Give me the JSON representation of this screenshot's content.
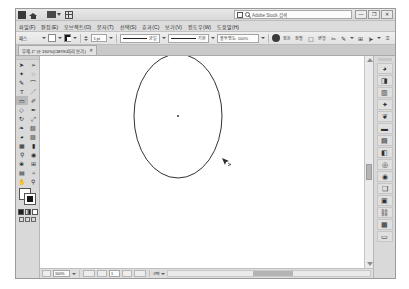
{
  "app": {
    "name": "Adobe Illustrator",
    "search_placeholder": "Adobe Stock 검색",
    "window_buttons": {
      "minimize": "—",
      "restore": "❐",
      "close": "✕"
    }
  },
  "titlebar": {
    "icons": [
      "app-icon",
      "home-icon",
      "arrange-documents-icon",
      "grid-icon"
    ],
    "stock_icon": "stock-icon",
    "search_icon": "search-icon"
  },
  "menubar": {
    "items": [
      {
        "label": "파일(F)",
        "name": "menu-file"
      },
      {
        "label": "편집(E)",
        "name": "menu-edit"
      },
      {
        "label": "오브젝트(O)",
        "name": "menu-object"
      },
      {
        "label": "문자(T)",
        "name": "menu-type"
      },
      {
        "label": "선택(S)",
        "name": "menu-select"
      },
      {
        "label": "효과(C)",
        "name": "menu-effect"
      },
      {
        "label": "보기(V)",
        "name": "menu-view"
      },
      {
        "label": "윈도우(W)",
        "name": "menu-window"
      },
      {
        "label": "도움말(H)",
        "name": "menu-help"
      }
    ]
  },
  "controlbar": {
    "selection_label": "패스",
    "fill_color": "#ffffff",
    "stroke_color": "#1a1a1a",
    "stroke_weight_label": "획:",
    "stroke_weight_value": "1 pt",
    "stroke_profile_value": "균일",
    "brush_value": "기본",
    "opacity_label": "불투명도: 100%",
    "style_label": "스타일:",
    "buttons": [
      {
        "label": "정돈",
        "name": "arrange-button"
      },
      {
        "label": "정렬",
        "name": "align-button"
      },
      {
        "label": "변형",
        "name": "transform-button"
      },
      {
        "label": "분리",
        "name": "isolate-button"
      },
      {
        "label": "모양",
        "name": "shape-button"
      }
    ],
    "icons": [
      "opacity-disk-icon",
      "arrange-icon",
      "align-icon",
      "transform-icon",
      "shape-builder-icon",
      "scissors-icon",
      "pen-edit-icon",
      "grid-icon",
      "margin-icon",
      "overflow-icon"
    ]
  },
  "document_tab": {
    "title": "무제-1* @ 150%(CMYK/미리 보기)",
    "close_label": "✕"
  },
  "toolbox": {
    "tools": [
      {
        "name": "tool-selection",
        "glyph": "➤",
        "selected": false
      },
      {
        "name": "tool-direct-selection",
        "glyph": "➢",
        "selected": false
      },
      {
        "name": "tool-magic-wand",
        "glyph": "✦",
        "selected": false
      },
      {
        "name": "tool-lasso",
        "glyph": "◌",
        "selected": false
      },
      {
        "name": "tool-pen",
        "glyph": "✎",
        "selected": false
      },
      {
        "name": "tool-curvature",
        "glyph": "⌒",
        "selected": false
      },
      {
        "name": "tool-type",
        "glyph": "T",
        "selected": false
      },
      {
        "name": "tool-line-segment",
        "glyph": "／",
        "selected": false
      },
      {
        "name": "tool-rectangle",
        "glyph": "▭",
        "selected": true
      },
      {
        "name": "tool-paintbrush",
        "glyph": "✐",
        "selected": false
      },
      {
        "name": "tool-shaper",
        "glyph": "◇",
        "selected": false
      },
      {
        "name": "tool-pencil",
        "glyph": "✒",
        "selected": false
      },
      {
        "name": "tool-rotate",
        "glyph": "↻",
        "selected": false
      },
      {
        "name": "tool-scale",
        "glyph": "⤢",
        "selected": false
      },
      {
        "name": "tool-width",
        "glyph": "❧",
        "selected": false
      },
      {
        "name": "tool-free-transform",
        "glyph": "▧",
        "selected": false
      },
      {
        "name": "tool-shape-builder",
        "glyph": "◕",
        "selected": false
      },
      {
        "name": "tool-perspective-grid",
        "glyph": "▨",
        "selected": false
      },
      {
        "name": "tool-mesh",
        "glyph": "▦",
        "selected": false
      },
      {
        "name": "tool-gradient",
        "glyph": "▮",
        "selected": false
      },
      {
        "name": "tool-eyedropper",
        "glyph": "⚲",
        "selected": false
      },
      {
        "name": "tool-blend",
        "glyph": "◉",
        "selected": false
      },
      {
        "name": "tool-symbol-sprayer",
        "glyph": "❀",
        "selected": false
      },
      {
        "name": "tool-column-graph",
        "glyph": "⊞",
        "selected": false
      },
      {
        "name": "tool-artboard",
        "glyph": "▤",
        "selected": false
      },
      {
        "name": "tool-slice",
        "glyph": "⌗",
        "selected": false
      },
      {
        "name": "tool-hand",
        "glyph": "✋",
        "selected": false
      },
      {
        "name": "tool-zoom",
        "glyph": "⚲",
        "selected": false
      }
    ],
    "fill_swatch": "#ffffff",
    "stroke_swatch": "#171717",
    "color_modes": [
      "color-mode",
      "gradient-mode",
      "none-mode"
    ],
    "screen_modes": [
      "normal-screen-mode",
      "full-screen-menu-mode",
      "full-screen-mode"
    ]
  },
  "dock": {
    "items": [
      {
        "name": "panel-color",
        "glyph": "◕"
      },
      {
        "name": "panel-color-guide",
        "glyph": "◨"
      },
      {
        "name": "panel-swatches",
        "glyph": "▥"
      },
      {
        "name": "panel-brushes",
        "glyph": "✦"
      },
      {
        "name": "panel-symbols",
        "glyph": "❦"
      },
      {
        "name": "panel-stroke",
        "glyph": "▬"
      },
      {
        "name": "panel-gradient",
        "glyph": "▤"
      },
      {
        "name": "panel-transparency",
        "glyph": "◧"
      },
      {
        "name": "panel-appearance",
        "glyph": "◎"
      },
      {
        "name": "panel-graphic-styles",
        "glyph": "◉"
      },
      {
        "name": "panel-layers",
        "glyph": "❑"
      },
      {
        "name": "panel-artboards",
        "glyph": "▣"
      },
      {
        "name": "panel-links",
        "glyph": "⛓"
      },
      {
        "name": "panel-libraries",
        "glyph": "▦"
      },
      {
        "name": "panel-properties",
        "glyph": "▭"
      }
    ]
  },
  "canvas": {
    "shape": {
      "type": "ellipse",
      "name": "ellipse-path",
      "cx": 163,
      "cy": 108,
      "rx": 44,
      "ry": 62,
      "stroke": "#1a1a1a",
      "fill": "none"
    },
    "center_point": {
      "x": 163,
      "y": 108
    },
    "cursor": {
      "x": 207,
      "y": 150,
      "name": "direct-selection-cursor"
    }
  },
  "statusbar": {
    "zoom_value": "100%",
    "tool_status": "선택",
    "artboard_nav": "1"
  },
  "colors": {
    "chrome": "#d4d4d4",
    "panel": "#d9d9d9",
    "canvas": "#ffffff",
    "accent": "#b9b9b9",
    "stroke": "#1a1a1a"
  }
}
